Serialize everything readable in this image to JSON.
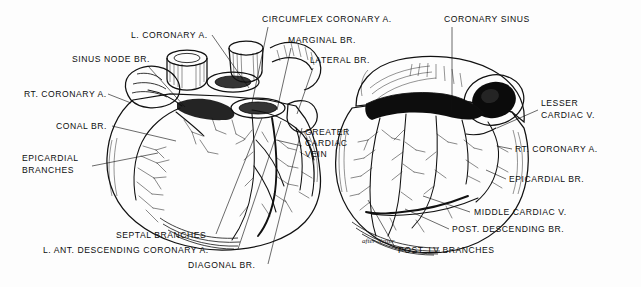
{
  "figure": {
    "signature": "after Netter",
    "background_color": "#fdfdfd",
    "ink_color": "#111111"
  },
  "panels": [
    {
      "id": "anterior",
      "name": "anterior-view-heart",
      "caption": ""
    },
    {
      "id": "posterior",
      "name": "posterior-view-heart",
      "caption": ""
    }
  ],
  "labels": [
    {
      "id": "l-coronary-a",
      "text": "L. CORONARY A.",
      "x": 131,
      "y": 38,
      "anchor": "start"
    },
    {
      "id": "sinus-node-br",
      "text": "SINUS NODE BR.",
      "x": 72,
      "y": 62,
      "anchor": "start"
    },
    {
      "id": "rt-coronary-a-left",
      "text": "RT. CORONARY A.",
      "x": 24,
      "y": 97,
      "anchor": "start"
    },
    {
      "id": "conal-br",
      "text": "CONAL BR.",
      "x": 56,
      "y": 129,
      "anchor": "start"
    },
    {
      "id": "epicardial-branches1",
      "text": "EPICARDIAL",
      "x": 22,
      "y": 161,
      "anchor": "start"
    },
    {
      "id": "epicardial-branches2",
      "text": "BRANCHES",
      "x": 22,
      "y": 173,
      "anchor": "start"
    },
    {
      "id": "circumflex-coronary-a",
      "text": "CIRCUMFLEX  CORONARY A.",
      "x": 262,
      "y": 22,
      "anchor": "start"
    },
    {
      "id": "marginal-br",
      "text": "MARGINAL BR.",
      "x": 288,
      "y": 43,
      "anchor": "start"
    },
    {
      "id": "lateral-br",
      "text": "LATERAL BR.",
      "x": 310,
      "y": 63,
      "anchor": "start"
    },
    {
      "id": "greater-cardiac-vein1",
      "text": "GREATER",
      "x": 305,
      "y": 135,
      "anchor": "start"
    },
    {
      "id": "greater-cardiac-vein2",
      "text": "CARDIAC",
      "x": 305,
      "y": 146,
      "anchor": "start"
    },
    {
      "id": "greater-cardiac-vein3",
      "text": "VEIN",
      "x": 305,
      "y": 157,
      "anchor": "start"
    },
    {
      "id": "septal-branches",
      "text": "SEPTAL  BRANCHES",
      "x": 116,
      "y": 238,
      "anchor": "start"
    },
    {
      "id": "l-ant-descending",
      "text": "L. ANT. DESCENDING  CORONARY A.",
      "x": 43,
      "y": 253,
      "anchor": "start"
    },
    {
      "id": "diagonal-br",
      "text": "DIAGONAL BR.",
      "x": 188,
      "y": 268,
      "anchor": "start"
    },
    {
      "id": "coronary-sinus",
      "text": "CORONARY SINUS",
      "x": 444,
      "y": 22,
      "anchor": "start"
    },
    {
      "id": "lesser-cardiac-v1",
      "text": "LESSER",
      "x": 541,
      "y": 106,
      "anchor": "start"
    },
    {
      "id": "lesser-cardiac-v2",
      "text": "CARDIAC V.",
      "x": 541,
      "y": 118,
      "anchor": "start"
    },
    {
      "id": "rt-coronary-a-right",
      "text": "RT. CORONARY A.",
      "x": 515,
      "y": 152,
      "anchor": "start"
    },
    {
      "id": "epicardial-br",
      "text": "EPICARDIAL BR.",
      "x": 509,
      "y": 182,
      "anchor": "start"
    },
    {
      "id": "middle-cardiac-v",
      "text": "MIDDLE CARDIAC V.",
      "x": 474,
      "y": 215,
      "anchor": "start"
    },
    {
      "id": "post-descending-br",
      "text": "POST. DESCENDING BR.",
      "x": 452,
      "y": 232,
      "anchor": "start"
    },
    {
      "id": "post-lv-branches",
      "text": "POST. LV BRANCHES",
      "x": 398,
      "y": 253,
      "anchor": "start"
    }
  ],
  "leaders": [
    {
      "id": "ld-l-coronary-a",
      "for": "l-coronary-a",
      "d": "M 212 35 L 249 88"
    },
    {
      "id": "ld-sinus-node-br",
      "for": "sinus-node-br",
      "d": "M 148 66 L 185 107"
    },
    {
      "id": "ld-rt-coronary-a-left",
      "for": "rt-coronary-a-left",
      "d": "M 108 94 L 129 103"
    },
    {
      "id": "ld-conal-br",
      "for": "conal-br",
      "d": "M 112 126 L 175 140"
    },
    {
      "id": "ld-epicardial-br-left",
      "for": "epicardial-branches1",
      "d": "M 92 164 L 160 154"
    },
    {
      "id": "ld-circumflex",
      "for": "circumflex-coronary-a",
      "d": "M 268 27 L 251 102"
    },
    {
      "id": "ld-marginal-br",
      "for": "marginal-br",
      "d": "M 291 48 L 276 108"
    },
    {
      "id": "ld-lateral-br",
      "for": "lateral-br",
      "d": "M 313 68 L 295 112"
    },
    {
      "id": "ld-greater-cardiac",
      "for": "greater-cardiac-vein1",
      "d": "M 302 145 L 276 139"
    },
    {
      "id": "ld-septal-branches",
      "for": "septal-branches",
      "d": "M 216 234 L 262 117"
    },
    {
      "id": "ld-l-ant-descending",
      "for": "l-ant-descending",
      "d": "M 236 249 L 280 120"
    },
    {
      "id": "ld-diagonal-br",
      "for": "diagonal-br",
      "d": "M 268 264 L 301 127"
    },
    {
      "id": "ld-coronary-sinus",
      "for": "coronary-sinus",
      "d": "M 452 27 L 452 110"
    },
    {
      "id": "ld-lesser-cardiac",
      "for": "lesser-cardiac-v1",
      "d": "M 538 110 L 497 128"
    },
    {
      "id": "ld-rt-coronary-right",
      "for": "rt-coronary-a-right",
      "d": "M 512 149 L 497 147"
    },
    {
      "id": "ld-epicardial-br-right",
      "for": "epicardial-br",
      "d": "M 506 179 L 487 170"
    },
    {
      "id": "ld-middle-cardiac",
      "for": "middle-cardiac-v",
      "d": "M 470 212 L 424 196"
    },
    {
      "id": "ld-post-descending",
      "for": "post-descending-br",
      "d": "M 449 229 L 406 210"
    },
    {
      "id": "ld-post-lv-branches",
      "for": "post-lv-branches",
      "d": "M 396 249 L 368 200"
    }
  ]
}
